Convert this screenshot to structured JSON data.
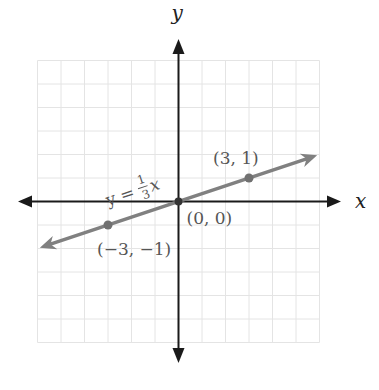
{
  "chart_data": {
    "type": "line",
    "title": "",
    "xlabel": "x",
    "ylabel": "y",
    "xlim": [
      -6,
      6
    ],
    "ylim": [
      -6,
      6
    ],
    "grid": true,
    "grid_step": 1,
    "series": [
      {
        "name": "y = 1/3 x",
        "equation": "y = (1/3)x",
        "slope_numerator": "1",
        "slope_denominator": "3",
        "x_range": [
          -6,
          6
        ],
        "color": "#808080"
      }
    ],
    "points": [
      {
        "x": -3,
        "y": -1,
        "label": "(−3, −1)"
      },
      {
        "x": 0,
        "y": 0,
        "label": "(0, 0)"
      },
      {
        "x": 3,
        "y": 1,
        "label": "(3, 1)"
      }
    ],
    "annotations": {
      "equation_prefix": "y =",
      "equation_num": "1",
      "equation_den": "3",
      "equation_var": "x"
    }
  },
  "colors": {
    "axis": "#1a1a1a",
    "grid": "#e4e4e4",
    "line": "#808080",
    "label": "#555555"
  }
}
